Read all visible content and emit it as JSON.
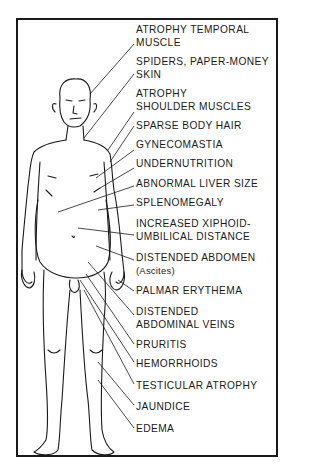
{
  "diagram": {
    "title": "",
    "figure": "standing male figure",
    "labels": [
      {
        "id": "atrophy-temporal-muscle",
        "lines": [
          "ATROPHY TEMPORAL",
          "MUSCLE"
        ],
        "top": 24
      },
      {
        "id": "spiders-paper-money-skin",
        "lines": [
          "SPIDERS, PAPER-MONEY",
          "SKIN"
        ],
        "top": 56
      },
      {
        "id": "atrophy-shoulder-muscles",
        "lines": [
          "ATROPHY",
          "SHOULDER MUSCLES"
        ],
        "top": 88
      },
      {
        "id": "sparse-body-hair",
        "lines": [
          "SPARSE BODY HAIR"
        ],
        "top": 120
      },
      {
        "id": "gynecomastia",
        "lines": [
          "GYNECOMASTIA"
        ],
        "top": 139
      },
      {
        "id": "undernutrition",
        "lines": [
          "UNDERNUTRITION"
        ],
        "top": 158
      },
      {
        "id": "abnormal-liver-size",
        "lines": [
          "ABNORMAL LIVER SIZE"
        ],
        "top": 178
      },
      {
        "id": "splenomegaly",
        "lines": [
          "SPLENOMEGALY"
        ],
        "top": 197
      },
      {
        "id": "increased-xiphoid-umbilical-distance",
        "lines": [
          "INCREASED XIPHOID-",
          "UMBILICAL DISTANCE"
        ],
        "top": 218
      },
      {
        "id": "distended-abdomen",
        "lines": [
          "DISTENDED ABDOMEN",
          "(Ascites)"
        ],
        "top": 252
      },
      {
        "id": "palmar-erythema",
        "lines": [
          "PALMAR ERYTHEMA"
        ],
        "top": 285
      },
      {
        "id": "distended-abdominal-veins",
        "lines": [
          "DISTENDED",
          "ABDOMINAL VEINS"
        ],
        "top": 306
      },
      {
        "id": "pruritis",
        "lines": [
          "PRURITIS"
        ],
        "top": 339
      },
      {
        "id": "hemorrhoids",
        "lines": [
          "HEMORRHOIDS"
        ],
        "top": 358
      },
      {
        "id": "testicular-atrophy",
        "lines": [
          "TESTICULAR ATROPHY"
        ],
        "top": 380
      },
      {
        "id": "jaundice",
        "lines": [
          "JAUNDICE"
        ],
        "top": 401
      },
      {
        "id": "edema",
        "lines": [
          "EDEMA"
        ],
        "top": 423
      }
    ]
  }
}
